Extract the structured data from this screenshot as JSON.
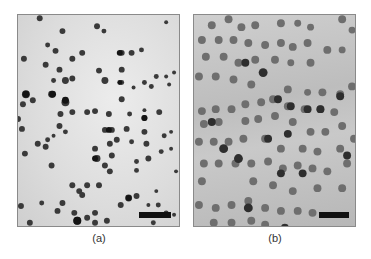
{
  "figure": {
    "panels": [
      {
        "id": "a",
        "label": "(a)",
        "description": "Micrograph of sparse dark spherical particles on a light background",
        "scale_bar": true
      },
      {
        "id": "b",
        "label": "(b)",
        "description": "Micrograph of dense chain-like aggregated spherical particles on a gray background",
        "scale_bar": true
      }
    ]
  },
  "colors": {
    "panel_a_background": "#dcdcdc",
    "panel_b_background": "#c2c2c2",
    "particle_dark": "#2a2a2a",
    "particle_mid": "#6a6a6a",
    "scale_bar": "#111111"
  }
}
